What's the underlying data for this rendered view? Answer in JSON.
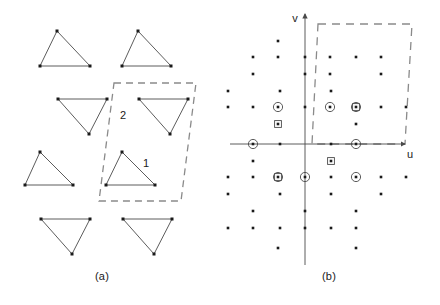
{
  "figure": {
    "width": 440,
    "height": 305,
    "background": "#ffffff",
    "line_color": "#4a4a4a",
    "dot_color": "#1a1a1a",
    "dash_color": "#8a8a8a",
    "axis_color": "#4a4a4a"
  },
  "panel_a": {
    "caption": "(a)",
    "triangle_labels": [
      {
        "id": "label-1",
        "text": "1",
        "x": 146,
        "y": 167
      },
      {
        "id": "label-2",
        "text": "2",
        "x": 123,
        "y": 119
      }
    ],
    "triangles": [
      {
        "name": "triangle-r1c1-up",
        "orientation": "up",
        "points": "57,31 40,66 90,66"
      },
      {
        "name": "triangle-r1c2-up",
        "orientation": "up",
        "points": "138,31 122,66 171,66"
      },
      {
        "name": "triangle-r2c1-down",
        "orientation": "down",
        "points": "58,99 107,99 89,134"
      },
      {
        "name": "triangle-r2c2-down",
        "orientation": "down",
        "points": "139,99 188,99 170,134"
      },
      {
        "name": "triangle-r3c1-up",
        "orientation": "up",
        "points": "40,152 25,185 73,185"
      },
      {
        "name": "triangle-r3c2-up",
        "orientation": "up",
        "points": "122,152 106,185 155,185"
      },
      {
        "name": "triangle-r4c1-down",
        "orientation": "down",
        "points": "41,219 90,219 72,254"
      },
      {
        "name": "triangle-r4c2-down",
        "orientation": "down",
        "points": "123,219 172,219 154,254"
      }
    ],
    "unit_cell": {
      "name": "unit-cell-outline",
      "points": "114,83 196,83 181,201 99,201"
    }
  },
  "panel_b": {
    "caption": "(b)",
    "axes": {
      "u_label": "u",
      "v_label": "v",
      "u_label_pos": {
        "x": 190,
        "y": 158
      },
      "v_label_pos": {
        "x": 75,
        "y": 22
      },
      "origin": {
        "x": 85,
        "y": 144
      },
      "u_line": {
        "x1": 10,
        "y1": 144,
        "x2": 185,
        "y2": 144
      },
      "v_line": {
        "x1": 85,
        "y1": 14,
        "x2": 85,
        "y2": 265
      }
    },
    "unit_cell": {
      "name": "reciprocal-cell-outline",
      "points": "98,24 192,24 185,144 92,144"
    },
    "marker_types": {
      "plain": "plain-dot",
      "circled": "circled-dot",
      "squared": "squared-dot",
      "circled_squared": "circled-squared-dot"
    },
    "lattice_points": [
      {
        "x": 58,
        "y": 41,
        "marker": "plain"
      },
      {
        "x": 33,
        "y": 57,
        "marker": "plain"
      },
      {
        "x": 58,
        "y": 57,
        "marker": "plain"
      },
      {
        "x": 85,
        "y": 57,
        "marker": "plain"
      },
      {
        "x": 110,
        "y": 57,
        "marker": "plain"
      },
      {
        "x": 136,
        "y": 57,
        "marker": "plain"
      },
      {
        "x": 161,
        "y": 57,
        "marker": "plain"
      },
      {
        "x": 33,
        "y": 74,
        "marker": "plain"
      },
      {
        "x": 85,
        "y": 74,
        "marker": "plain"
      },
      {
        "x": 110,
        "y": 74,
        "marker": "plain"
      },
      {
        "x": 161,
        "y": 74,
        "marker": "plain"
      },
      {
        "x": 8,
        "y": 91,
        "marker": "plain"
      },
      {
        "x": 60,
        "y": 91,
        "marker": "plain"
      },
      {
        "x": 111,
        "y": 91,
        "marker": "plain"
      },
      {
        "x": 8,
        "y": 107,
        "marker": "plain"
      },
      {
        "x": 33,
        "y": 107,
        "marker": "plain"
      },
      {
        "x": 58,
        "y": 107,
        "marker": "circled"
      },
      {
        "x": 85,
        "y": 107,
        "marker": "plain"
      },
      {
        "x": 110,
        "y": 107,
        "marker": "circled"
      },
      {
        "x": 136,
        "y": 107,
        "marker": "circled_squared"
      },
      {
        "x": 161,
        "y": 107,
        "marker": "plain"
      },
      {
        "x": 186,
        "y": 107,
        "marker": "plain"
      },
      {
        "x": 58,
        "y": 124,
        "marker": "squared"
      },
      {
        "x": 136,
        "y": 124,
        "marker": "plain"
      },
      {
        "x": 33,
        "y": 144,
        "marker": "circled"
      },
      {
        "x": 60,
        "y": 144,
        "marker": "plain"
      },
      {
        "x": 111,
        "y": 144,
        "marker": "plain"
      },
      {
        "x": 136,
        "y": 144,
        "marker": "circled"
      },
      {
        "x": 33,
        "y": 161,
        "marker": "plain"
      },
      {
        "x": 111,
        "y": 161,
        "marker": "squared"
      },
      {
        "x": 8,
        "y": 177,
        "marker": "plain"
      },
      {
        "x": 33,
        "y": 177,
        "marker": "plain"
      },
      {
        "x": 58,
        "y": 177,
        "marker": "circled_squared"
      },
      {
        "x": 85,
        "y": 177,
        "marker": "circled"
      },
      {
        "x": 111,
        "y": 177,
        "marker": "plain"
      },
      {
        "x": 136,
        "y": 177,
        "marker": "circled"
      },
      {
        "x": 161,
        "y": 177,
        "marker": "plain"
      },
      {
        "x": 186,
        "y": 177,
        "marker": "plain"
      },
      {
        "x": 8,
        "y": 194,
        "marker": "plain"
      },
      {
        "x": 60,
        "y": 194,
        "marker": "plain"
      },
      {
        "x": 111,
        "y": 194,
        "marker": "plain"
      },
      {
        "x": 161,
        "y": 194,
        "marker": "plain"
      },
      {
        "x": 33,
        "y": 211,
        "marker": "plain"
      },
      {
        "x": 85,
        "y": 211,
        "marker": "plain"
      },
      {
        "x": 136,
        "y": 211,
        "marker": "plain"
      },
      {
        "x": 8,
        "y": 228,
        "marker": "plain"
      },
      {
        "x": 33,
        "y": 228,
        "marker": "plain"
      },
      {
        "x": 60,
        "y": 228,
        "marker": "plain"
      },
      {
        "x": 85,
        "y": 228,
        "marker": "plain"
      },
      {
        "x": 111,
        "y": 228,
        "marker": "plain"
      },
      {
        "x": 136,
        "y": 228,
        "marker": "plain"
      },
      {
        "x": 58,
        "y": 248,
        "marker": "plain"
      },
      {
        "x": 136,
        "y": 248,
        "marker": "plain"
      }
    ]
  },
  "chart_data": {
    "type": "scatter",
    "title": "",
    "xlabel": "u",
    "ylabel": "v",
    "panels": [
      {
        "label": "(a)",
        "description": "Direct-space lattice of alternating up and down pointing triangles with dashed unit cell containing triangles 1 and 2",
        "annotations": [
          "1",
          "2"
        ]
      },
      {
        "label": "(b)",
        "description": "Reciprocal-space (u,v) diffraction pattern with plain, circled, squared and circled-squared lattice points and a dashed reciprocal cell",
        "annotations": [
          "u",
          "v"
        ]
      }
    ]
  }
}
